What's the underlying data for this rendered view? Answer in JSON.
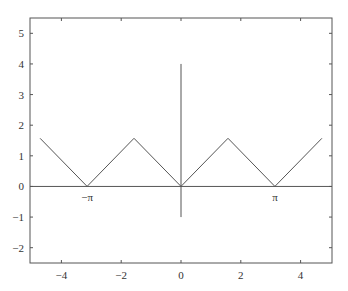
{
  "chart_data": {
    "type": "line",
    "title": "",
    "xlabel": "",
    "ylabel": "",
    "xlim": [
      -5.05,
      5.05
    ],
    "ylim": [
      -2.5,
      5.5
    ],
    "grid": false,
    "legend": null,
    "xticks": [
      -4,
      -2,
      0,
      2,
      4
    ],
    "xtick_labels": [
      "−4",
      "−2",
      "0",
      "2",
      "4"
    ],
    "yticks": [
      -2,
      -1,
      0,
      1,
      2,
      3,
      4,
      5
    ],
    "ytick_labels": [
      "−2",
      "−1",
      "0",
      "1",
      "2",
      "3",
      "4",
      "5"
    ],
    "series": [
      {
        "name": "|sin-like triangle wave| (sawtooth |x| periodic)",
        "x": [
          -4.712,
          -3.1416,
          -1.5708,
          0,
          1.5708,
          3.1416,
          4.712
        ],
        "y": [
          1.5708,
          0,
          1.5708,
          0,
          1.5708,
          0,
          1.5708
        ]
      }
    ],
    "reference_lines": [
      {
        "name": "x-axis line",
        "x": [
          -5.05,
          5.05
        ],
        "y": [
          0,
          0
        ]
      },
      {
        "name": "y-axis line",
        "x": [
          0,
          0
        ],
        "y": [
          -1,
          4
        ]
      }
    ],
    "annotations": [
      {
        "text": "−π",
        "x": -3.1416,
        "y": -0.35
      },
      {
        "text": "π",
        "x": 3.1416,
        "y": -0.35
      }
    ],
    "colors": {
      "line": "#555555",
      "axes": "#555555",
      "text": "#333333"
    }
  }
}
